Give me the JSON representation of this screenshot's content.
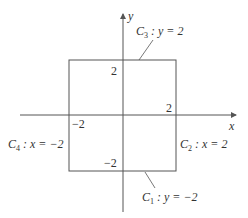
{
  "diagram": {
    "axes": {
      "x_label": "x",
      "y_label": "y"
    },
    "ticks": {
      "y_top": "2",
      "x_right": "2",
      "x_left": "−2",
      "y_bottom": "−2"
    },
    "curves": [
      {
        "id": "C1",
        "name": "C",
        "sub": "1",
        "eq": " : y = −2"
      },
      {
        "id": "C2",
        "name": "C",
        "sub": "2",
        "eq": " : x = 2"
      },
      {
        "id": "C3",
        "name": "C",
        "sub": "3",
        "eq": " : y = 2"
      },
      {
        "id": "C4",
        "name": "C",
        "sub": "4",
        "eq": " : x = −2"
      }
    ],
    "colors": {
      "line": "#555555",
      "text": "#333333"
    }
  }
}
